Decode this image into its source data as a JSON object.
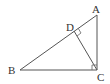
{
  "diagram": {
    "type": "geometry",
    "points": {
      "A": {
        "label": "A",
        "x": 97,
        "y": 15
      },
      "B": {
        "label": "B",
        "x": 20,
        "y": 70
      },
      "C": {
        "label": "C",
        "x": 97,
        "y": 70
      },
      "D": {
        "label": "D",
        "x": 74,
        "y": 31
      }
    },
    "segments": [
      "AB",
      "BC",
      "CA",
      "CD"
    ],
    "right_angles": [
      "ACB",
      "CDA"
    ],
    "colors": {
      "line": "#555555",
      "text": "#333333",
      "background": "#ffffff"
    }
  }
}
